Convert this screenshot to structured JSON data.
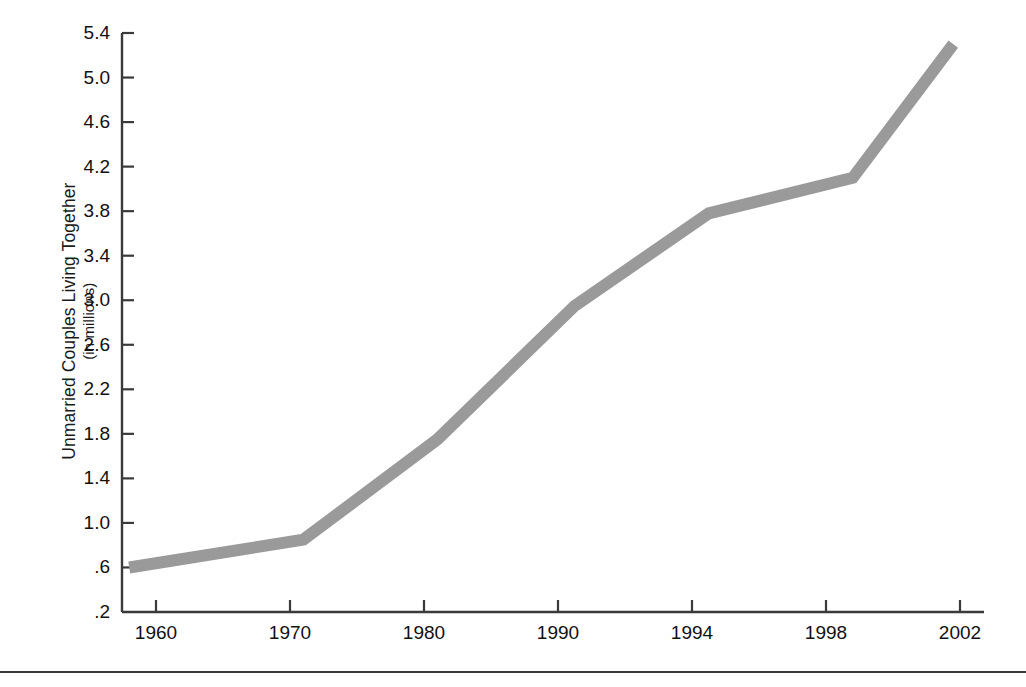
{
  "figure": {
    "name": "unmarried-couples-line-chart",
    "background_color": "#ffffff",
    "axis_color": "#3a3a3a",
    "text_color": "#111111",
    "separator_rule_color": "#3a3a3a"
  },
  "chart_data": {
    "type": "line",
    "title": "",
    "subtitle": "",
    "xlabel": "",
    "ylabel": "Unmarried Couples Living Together",
    "ylabel_sub": "(in millions)",
    "grid": false,
    "legend": false,
    "legend_position": "none",
    "series_color": "#9a9a9a",
    "line_width_px": 12,
    "xlim": [
      1958,
      2002
    ],
    "ylim": [
      0.2,
      5.4
    ],
    "x_tick_labels": [
      "1960",
      "1970",
      "1980",
      "1990",
      "1994",
      "1998",
      "2002"
    ],
    "x_ticks": [
      1960,
      1970,
      1980,
      1990,
      1994,
      1998,
      2002
    ],
    "y_tick_labels": [
      ".2",
      ".6",
      "1.0",
      "1.4",
      "1.8",
      "2.2",
      "2.6",
      "3.0",
      "3.4",
      "3.8",
      "4.2",
      "4.6",
      "5.0",
      "5.4"
    ],
    "y_ticks": [
      0.2,
      0.6,
      1.0,
      1.4,
      1.8,
      2.2,
      2.6,
      3.0,
      3.4,
      3.8,
      4.2,
      4.6,
      5.0,
      5.4
    ],
    "x": [
      1958,
      1971,
      1981,
      1990.5,
      1994.5,
      1998.8,
      2001.8
    ],
    "values": [
      0.6,
      0.85,
      1.75,
      2.95,
      3.78,
      4.1,
      5.3
    ],
    "series": [
      {
        "name": "Unmarried couples living together (millions)",
        "points": [
          {
            "x": 1958,
            "y": 0.6
          },
          {
            "x": 1971,
            "y": 0.85
          },
          {
            "x": 1981,
            "y": 1.75
          },
          {
            "x": 1990.5,
            "y": 2.95
          },
          {
            "x": 1994.5,
            "y": 3.78
          },
          {
            "x": 1998.8,
            "y": 4.1
          },
          {
            "x": 2001.8,
            "y": 5.3
          }
        ]
      }
    ]
  }
}
